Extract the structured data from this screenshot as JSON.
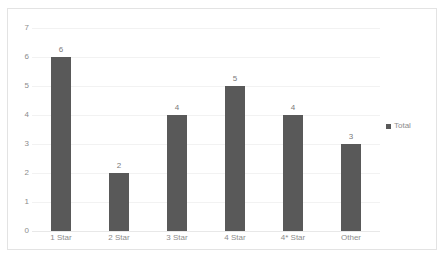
{
  "chart_data": {
    "type": "bar",
    "title": "",
    "xlabel": "",
    "ylabel": "",
    "categories": [
      "1 Star",
      "2 Star",
      "3 Star",
      "4 Star",
      "4* Star",
      "Other"
    ],
    "series": [
      {
        "name": "Total",
        "values": [
          6,
          2,
          4,
          5,
          4,
          3
        ],
        "color": "#595959"
      }
    ],
    "data_labels": [
      "6",
      "2",
      "4",
      "5",
      "4",
      "3"
    ],
    "ylim": [
      0,
      7
    ],
    "y_ticks": [
      "0",
      "1",
      "2",
      "3",
      "4",
      "5",
      "6",
      "7"
    ],
    "grid": true,
    "legend_position": "right",
    "legend_entries": [
      "Total"
    ]
  },
  "legend": {
    "label": "Total"
  }
}
